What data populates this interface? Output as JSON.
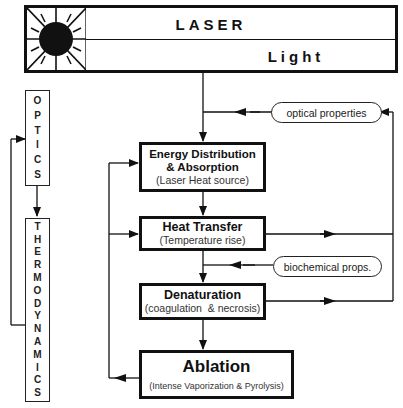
{
  "laser_box": {
    "top_label": "LASER",
    "bottom_label": "Light",
    "icon": "laser-hazard-sun-icon"
  },
  "side_labels": {
    "optics": "OPTICS",
    "thermodynamics": "THERMODYNAMICS"
  },
  "nodes": {
    "energy": {
      "title_line1": "Energy Distribution",
      "title_line2": "& Absorption",
      "subtitle": "(Laser Heat source)"
    },
    "heat": {
      "title": "Heat Transfer",
      "subtitle": "(Temperature rise)"
    },
    "denaturation": {
      "title": "Denaturation",
      "subtitle": "(coagulation  & necrosis)"
    },
    "ablation": {
      "title": "Ablation",
      "subtitle": "(Intense Vaporization & Pyrolysis)"
    }
  },
  "inputs": {
    "optical": "optical properties",
    "biochemical": "biochemical props."
  },
  "colors": {
    "ink": "#111111",
    "background": "#ffffff"
  }
}
